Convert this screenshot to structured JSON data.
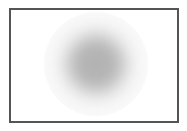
{
  "canvas": {
    "width": 187,
    "height": 131,
    "background": "#ffffff"
  },
  "frame": {
    "border_color": "#555555",
    "border_width": 2,
    "background": "#ffffff"
  },
  "blurred_circle": {
    "center_x": 85,
    "center_y": 54,
    "core_radius": 28,
    "halo_radius": 52,
    "core_color": "#b3b3b3",
    "halo_color": "#e6e6e6",
    "blur_px": 9
  }
}
